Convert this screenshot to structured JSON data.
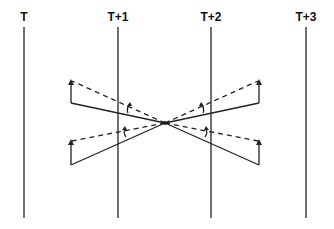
{
  "diagram": {
    "time_labels": [
      "T",
      "T+1",
      "T+2",
      "T+3"
    ],
    "timeline_x": [
      24,
      118,
      211,
      306
    ],
    "center": [
      165,
      123
    ]
  }
}
